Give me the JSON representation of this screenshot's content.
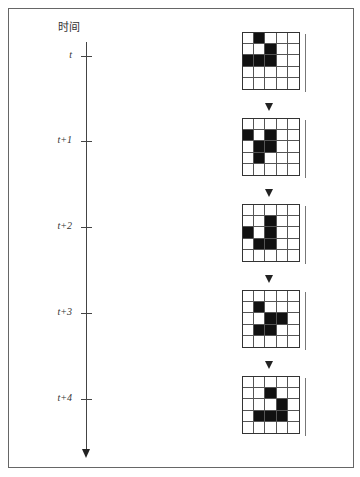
{
  "diagram": {
    "axis_title": "时间",
    "axis_direction": "down",
    "steps": [
      {
        "label": "t",
        "grid": [
          [
            0,
            1,
            0,
            0,
            0
          ],
          [
            0,
            0,
            1,
            0,
            0
          ],
          [
            1,
            1,
            1,
            0,
            0
          ],
          [
            0,
            0,
            0,
            0,
            0
          ],
          [
            0,
            0,
            0,
            0,
            0
          ]
        ]
      },
      {
        "label": "t+1",
        "grid": [
          [
            0,
            0,
            0,
            0,
            0
          ],
          [
            1,
            0,
            1,
            0,
            0
          ],
          [
            0,
            1,
            1,
            0,
            0
          ],
          [
            0,
            1,
            0,
            0,
            0
          ],
          [
            0,
            0,
            0,
            0,
            0
          ]
        ]
      },
      {
        "label": "t+2",
        "grid": [
          [
            0,
            0,
            0,
            0,
            0
          ],
          [
            0,
            0,
            1,
            0,
            0
          ],
          [
            1,
            0,
            1,
            0,
            0
          ],
          [
            0,
            1,
            1,
            0,
            0
          ],
          [
            0,
            0,
            0,
            0,
            0
          ]
        ]
      },
      {
        "label": "t+3",
        "grid": [
          [
            0,
            0,
            0,
            0,
            0
          ],
          [
            0,
            1,
            0,
            0,
            0
          ],
          [
            0,
            0,
            1,
            1,
            0
          ],
          [
            0,
            1,
            1,
            0,
            0
          ],
          [
            0,
            0,
            0,
            0,
            0
          ]
        ]
      },
      {
        "label": "t+4",
        "grid": [
          [
            0,
            0,
            0,
            0,
            0
          ],
          [
            0,
            0,
            1,
            0,
            0
          ],
          [
            0,
            0,
            0,
            1,
            0
          ],
          [
            0,
            1,
            1,
            1,
            0
          ],
          [
            0,
            0,
            0,
            0,
            0
          ]
        ]
      }
    ],
    "colors": {
      "cell_on": "#111111",
      "cell_off": "#ffffff",
      "grid_line": "#555555"
    }
  }
}
